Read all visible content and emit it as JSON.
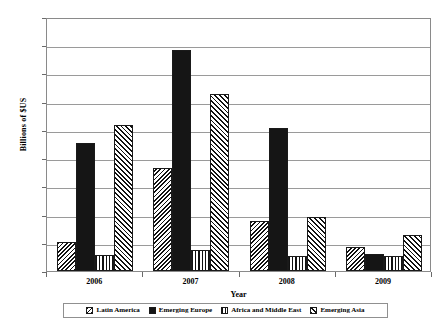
{
  "chart_data": {
    "type": "bar",
    "title": "",
    "xlabel": "Year",
    "ylabel": "Billions of $US",
    "categories": [
      "2006",
      "2007",
      "2008",
      "2009"
    ],
    "ylim": [
      0,
      450
    ],
    "yticks": [
      0,
      50,
      100,
      150,
      200,
      250,
      300,
      350,
      400,
      450
    ],
    "ytick_labels": [
      "0",
      "50",
      "100",
      "150",
      "200",
      "250",
      "300",
      "350",
      "400",
      "450"
    ],
    "grid": true,
    "legend_position": "bottom",
    "series": [
      {
        "name": "Latin America",
        "pattern": "diagonal-hatch-left",
        "values": [
          51,
          183,
          88,
          43
        ]
      },
      {
        "name": "Emerging Europe",
        "pattern": "solid-black",
        "values": [
          226,
          392,
          253,
          30
        ]
      },
      {
        "name": "Africa and Middle East",
        "pattern": "vertical-lines",
        "values": [
          28,
          38,
          27,
          27
        ]
      },
      {
        "name": "Emerging Asia",
        "pattern": "diagonal-hatch-right",
        "values": [
          259,
          314,
          96,
          64
        ]
      }
    ]
  },
  "colors": {
    "axis": "#8a8a8a",
    "gridline": "#9a9a9a",
    "bar_outline": "#1a1a1a",
    "solid_fill": "#151515",
    "background": "#ffffff"
  }
}
